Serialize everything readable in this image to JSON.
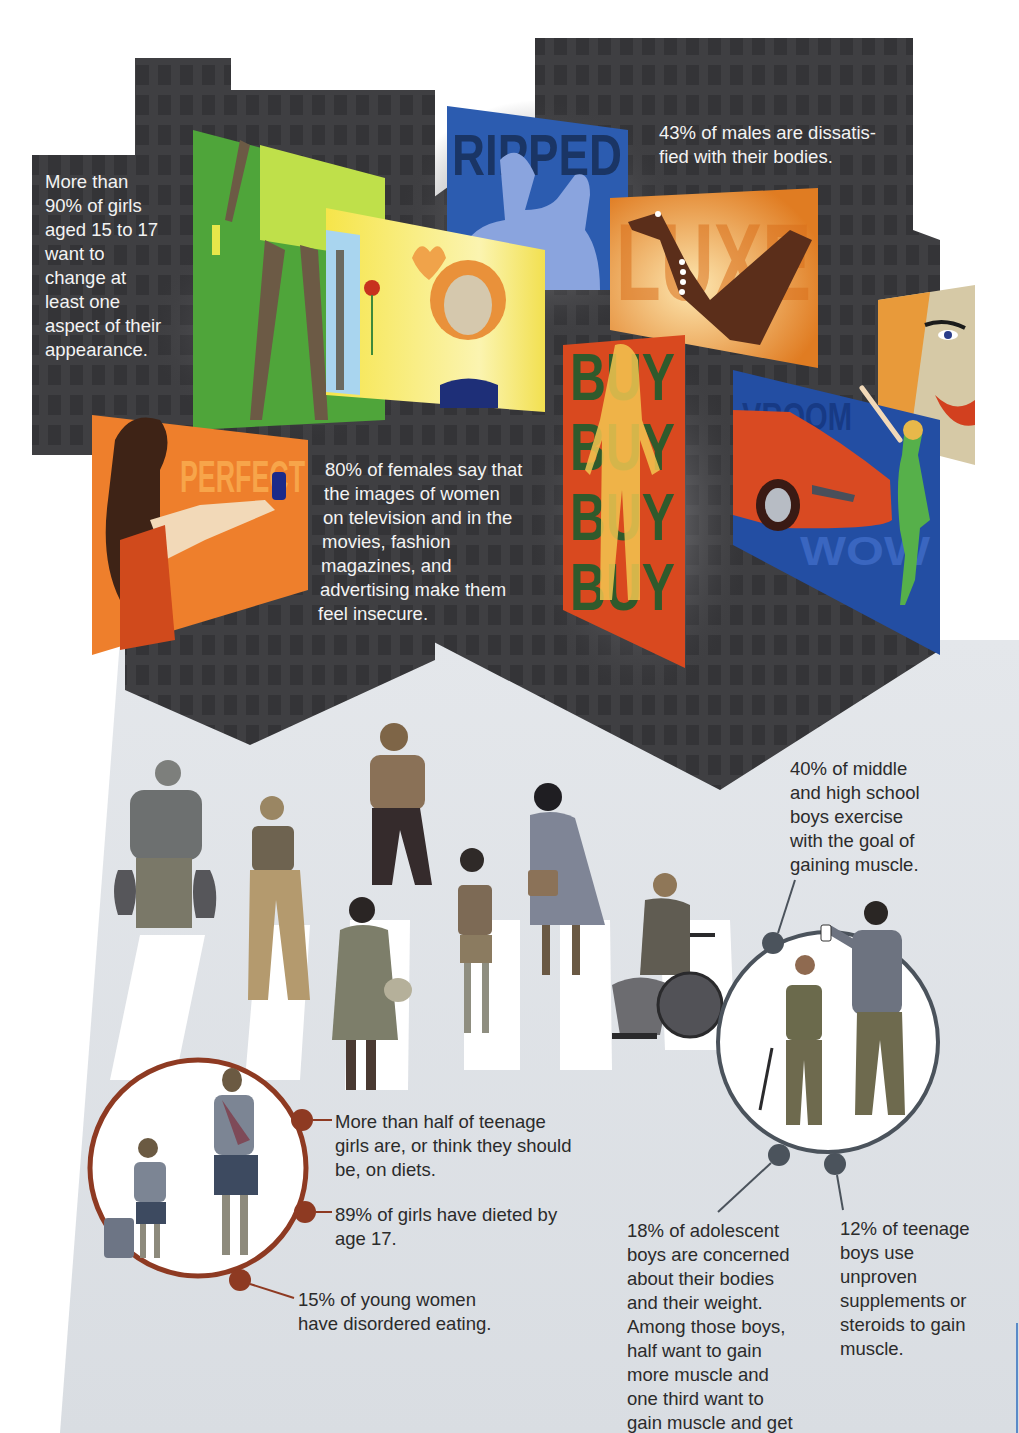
{
  "colors": {
    "building": "#3f3f42",
    "building_window": "#333336",
    "ground": "#dde1e6",
    "crosswalk": "#ffffff",
    "girls_ring": "#8e3a22",
    "boys_ring": "#4b535c",
    "text_light": "#f3f3f3",
    "text_dark": "#2b2b2b"
  },
  "billboards": [
    {
      "id": "legs",
      "word": "",
      "bg": "#4fa53a"
    },
    {
      "id": "ripped",
      "word": "RIPPED",
      "bg": "#2c5cb0"
    },
    {
      "id": "romance",
      "word": "",
      "bg": "#f6e54a"
    },
    {
      "id": "luxe",
      "word": "LUXE",
      "bg": "#e98a2a"
    },
    {
      "id": "perfect",
      "word": "PERFECT",
      "bg": "#ee7f2c"
    },
    {
      "id": "buy",
      "words": [
        "BUY",
        "BUY",
        "BUY",
        "BUY"
      ],
      "bg": "#d9491f"
    },
    {
      "id": "vroom",
      "word": "VROOM",
      "word2": "WOW",
      "bg": "#234ea3"
    },
    {
      "id": "smile",
      "word": "",
      "bg": "#d6c9a6"
    }
  ],
  "stats": {
    "girls_change_appearance": [
      "More than",
      "90% of girls",
      "aged 15 to 17",
      "want to",
      "change at",
      "least one",
      "aspect of their",
      "appearance."
    ],
    "males_dissatisfied": [
      "43% of males are dissatis-",
      "fied with their bodies."
    ],
    "females_insecure": [
      "80% of females say that",
      "the images of women",
      "on television and in the",
      "movies, fashion",
      "magazines, and",
      "advertising make them",
      "feel insecure."
    ],
    "boys_exercise": [
      "40% of middle",
      "and high school",
      "boys exercise",
      "with the goal of",
      "gaining muscle."
    ],
    "girls_diets": [
      "More than half of teenage",
      "girls are, or think they should",
      "be, on diets."
    ],
    "girls_dieted": [
      "89% of girls have dieted by",
      "age 17."
    ],
    "disordered_eating": [
      "15% of young women",
      "have disordered eating."
    ],
    "boys_concerned": [
      "18% of adolescent",
      "boys are concerned",
      "about their bodies",
      "and their weight.",
      "Among those boys,",
      "half want to gain",
      "more muscle and",
      "one third want to",
      "gain muscle and get"
    ],
    "boys_supplements": [
      "12% of teenage",
      "boys use",
      "unproven",
      "supplements or",
      "steroids to gain",
      "muscle."
    ]
  }
}
